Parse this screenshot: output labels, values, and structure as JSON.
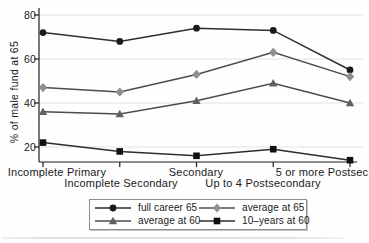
{
  "chart_data": {
    "type": "line",
    "title": "",
    "xlabel": "",
    "ylabel": "% of male fund at 65",
    "ylim": [
      13,
      83
    ],
    "yticks": [
      20,
      40,
      60,
      80
    ],
    "grid": true,
    "legend_position": "bottom-boxed",
    "categories": [
      "Incomplete Primary",
      "Incomplete Secondary",
      "Secondary",
      "Up to 4 Postsecondary",
      "5 or more Postsec"
    ],
    "series": [
      {
        "name": "full career 65",
        "marker": "circle",
        "line_color": "#2e2e2e",
        "marker_color": "#1b1b1b",
        "values": [
          72,
          68,
          74,
          73,
          55
        ]
      },
      {
        "name": "average at 65",
        "marker": "diamond",
        "line_color": "#4c4c4c",
        "marker_color": "#8f8f8f",
        "values": [
          47,
          45,
          53,
          63,
          52
        ]
      },
      {
        "name": "average at 60",
        "marker": "triangle",
        "line_color": "#4c4c4c",
        "marker_color": "#5f5f5f",
        "values": [
          36,
          35,
          41,
          49,
          40
        ]
      },
      {
        "name": "10–years at 60",
        "marker": "square",
        "line_color": "#2e2e2e",
        "marker_color": "#111111",
        "values": [
          22,
          18,
          16,
          19,
          14
        ]
      }
    ],
    "colors": {
      "axis": "#1f1f1f",
      "grid": "#e2e2e2",
      "text": "#1a1a1a",
      "background": "#ffffff",
      "legend_border": "#8c8c8c"
    }
  }
}
